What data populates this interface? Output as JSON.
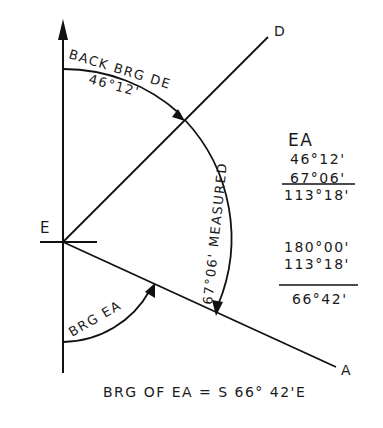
{
  "diagram": {
    "points": {
      "E": "E",
      "D": "D",
      "A": "A"
    },
    "arcs": {
      "back_bearing_label_1": "BACK BRG DE",
      "back_bearing_value": "46°12'",
      "measured_label": "67°06' MEASURED",
      "bearing_ea_label": "BRG EA"
    },
    "computation": {
      "title": "EA",
      "step1": {
        "line1": "46°12'",
        "line2": "67°06'",
        "result": "113°18'"
      },
      "step2": {
        "line1": "180°00'",
        "line2": "113°18'",
        "result": "66°42'"
      }
    },
    "conclusion": "BRG OF EA = S 66° 42'E"
  }
}
